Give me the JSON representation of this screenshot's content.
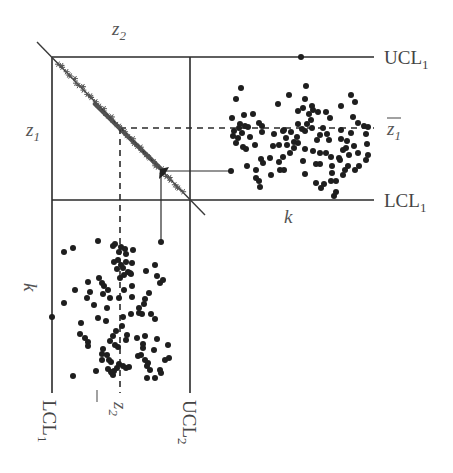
{
  "diagram": {
    "labels": {
      "z2_axis": "z",
      "z2_axis_sub": "2",
      "z1_axis": "z",
      "z1_axis_sub": "1",
      "ucl1": "UCL",
      "ucl1_sub": "1",
      "lcl1_right": "LCL",
      "lcl1_right_sub": "1",
      "z1_bar": "z",
      "z1_bar_sub": "1",
      "k_right": "k",
      "k_left": "k",
      "lcl1_bottom": "LCL",
      "lcl1_bottom_sub": "1",
      "z2_bar": "z",
      "z2_bar_sub": "2",
      "ucl2": "UCL",
      "ucl2_sub": "2"
    },
    "geometry": {
      "box_left": 52,
      "box_top": 57,
      "box_mid_x": 190,
      "box_mid_y": 200,
      "right_end": 374,
      "bottom_end": 393,
      "z1_bar_y": 128,
      "z2_bar_x": 120,
      "diag_start": [
        37,
        42
      ],
      "diag_end": [
        205,
        215
      ]
    },
    "arrow_point": {
      "source": [
        163,
        172
      ],
      "to_right_dot": [
        231,
        171
      ],
      "to_bottom_dot": [
        161,
        242
      ]
    },
    "colors": {
      "line": "#2a2a2a",
      "dot": "#1e1e1e",
      "label": "#444444"
    },
    "top_right_chart": {
      "name": "z1 chart (k horizontal)",
      "points": [
        [
          301,
          57
        ],
        [
          241,
          88
        ],
        [
          236,
          99
        ],
        [
          289,
          95
        ],
        [
          244,
          115
        ],
        [
          278,
          104
        ],
        [
          306,
          86
        ],
        [
          253,
          114
        ],
        [
          259,
          123
        ],
        [
          262,
          126
        ],
        [
          248,
          127
        ],
        [
          262,
          132
        ],
        [
          274,
          134
        ],
        [
          283,
          131
        ],
        [
          298,
          111
        ],
        [
          305,
          99
        ],
        [
          303,
          108
        ],
        [
          309,
          114
        ],
        [
          313,
          110
        ],
        [
          318,
          112
        ],
        [
          311,
          120
        ],
        [
          317,
          140
        ],
        [
          298,
          143
        ],
        [
          294,
          142
        ],
        [
          287,
          145
        ],
        [
          279,
          145
        ],
        [
          283,
          157
        ],
        [
          284,
          130
        ],
        [
          298,
          124
        ],
        [
          307,
          124
        ],
        [
          320,
          135
        ],
        [
          327,
          134
        ],
        [
          329,
          140
        ],
        [
          341,
          139
        ],
        [
          354,
          146
        ],
        [
          339,
          158
        ],
        [
          345,
          170
        ],
        [
          355,
          170
        ],
        [
          359,
          166
        ],
        [
          366,
          160
        ],
        [
          368,
          155
        ],
        [
          358,
          153
        ],
        [
          343,
          150
        ],
        [
          349,
          155
        ],
        [
          340,
          160
        ],
        [
          332,
          166
        ],
        [
          320,
          153
        ],
        [
          313,
          151
        ],
        [
          305,
          149
        ],
        [
          294,
          148
        ],
        [
          290,
          153
        ],
        [
          284,
          170
        ],
        [
          280,
          170
        ],
        [
          263,
          163
        ],
        [
          261,
          159
        ],
        [
          256,
          170
        ],
        [
          247,
          166
        ],
        [
          233,
          136
        ],
        [
          234,
          131
        ],
        [
          236,
          143
        ],
        [
          238,
          138
        ],
        [
          242,
          133
        ],
        [
          239,
          128
        ],
        [
          240,
          124
        ],
        [
          245,
          126
        ],
        [
          250,
          137
        ],
        [
          243,
          147
        ],
        [
          255,
          145
        ],
        [
          246,
          149
        ],
        [
          232,
          118
        ],
        [
          270,
          158
        ],
        [
          256,
          178
        ],
        [
          259,
          181
        ],
        [
          260,
          187
        ],
        [
          271,
          175
        ],
        [
          273,
          146
        ],
        [
          279,
          162
        ],
        [
          303,
          161
        ],
        [
          305,
          174
        ],
        [
          316,
          164
        ],
        [
          320,
          164
        ],
        [
          331,
          157
        ],
        [
          331,
          181
        ],
        [
          332,
          173
        ],
        [
          336,
          181
        ],
        [
          343,
          175
        ],
        [
          346,
          148
        ],
        [
          348,
          166
        ],
        [
          347,
          141
        ],
        [
          351,
          133
        ],
        [
          358,
          123
        ],
        [
          364,
          126
        ],
        [
          368,
          127
        ],
        [
          366,
          134
        ],
        [
          367,
          144
        ],
        [
          355,
          102
        ],
        [
          351,
          95
        ],
        [
          341,
          106
        ],
        [
          353,
          117
        ],
        [
          341,
          130
        ],
        [
          326,
          153
        ],
        [
          334,
          196
        ],
        [
          336,
          192
        ],
        [
          321,
          188
        ],
        [
          316,
          183
        ],
        [
          324,
          184
        ],
        [
          323,
          128
        ],
        [
          330,
          118
        ],
        [
          326,
          112
        ],
        [
          312,
          106
        ],
        [
          302,
          129
        ],
        [
          291,
          132
        ],
        [
          286,
          138
        ],
        [
          297,
          137
        ],
        [
          305,
          131
        ],
        [
          312,
          128
        ]
      ]
    },
    "bottom_left_chart": {
      "name": "z2 chart (k vertical)",
      "points": [
        [
          52,
          317
        ],
        [
          64,
          252
        ],
        [
          73,
          248
        ],
        [
          98,
          241
        ],
        [
          113,
          246
        ],
        [
          115,
          244
        ],
        [
          121,
          247
        ],
        [
          125,
          249
        ],
        [
          119,
          252
        ],
        [
          126,
          254
        ],
        [
          133,
          250
        ],
        [
          114,
          262
        ],
        [
          118,
          260
        ],
        [
          126,
          262
        ],
        [
          132,
          263
        ],
        [
          121,
          265
        ],
        [
          117,
          269
        ],
        [
          123,
          268
        ],
        [
          128,
          272
        ],
        [
          131,
          274
        ],
        [
          124,
          275
        ],
        [
          120,
          278
        ],
        [
          99,
          278
        ],
        [
          102,
          283
        ],
        [
          104,
          286
        ],
        [
          108,
          290
        ],
        [
          103,
          294
        ],
        [
          110,
          298
        ],
        [
          119,
          298
        ],
        [
          124,
          290
        ],
        [
          132,
          286
        ],
        [
          130,
          273
        ],
        [
          146,
          271
        ],
        [
          155,
          265
        ],
        [
          157,
          276
        ],
        [
          160,
          283
        ],
        [
          163,
          280
        ],
        [
          149,
          293
        ],
        [
          145,
          299
        ],
        [
          144,
          304
        ],
        [
          142,
          314
        ],
        [
          155,
          319
        ],
        [
          151,
          314
        ],
        [
          132,
          297
        ],
        [
          75,
          290
        ],
        [
          88,
          282
        ],
        [
          90,
          292
        ],
        [
          87,
          298
        ],
        [
          64,
          303
        ],
        [
          94,
          305
        ],
        [
          107,
          308
        ],
        [
          98,
          318
        ],
        [
          123,
          317
        ],
        [
          131,
          314
        ],
        [
          139,
          313
        ],
        [
          106,
          321
        ],
        [
          81,
          323
        ],
        [
          80,
          334
        ],
        [
          85,
          338
        ],
        [
          88,
          342
        ],
        [
          88,
          346
        ],
        [
          103,
          349
        ],
        [
          110,
          341
        ],
        [
          118,
          347
        ],
        [
          115,
          345
        ],
        [
          126,
          340
        ],
        [
          127,
          335
        ],
        [
          137,
          338
        ],
        [
          145,
          336
        ],
        [
          143,
          344
        ],
        [
          138,
          356
        ],
        [
          145,
          360
        ],
        [
          148,
          363
        ],
        [
          165,
          360
        ],
        [
          169,
          358
        ],
        [
          160,
          370
        ],
        [
          168,
          345
        ],
        [
          154,
          350
        ],
        [
          157,
          339
        ],
        [
          139,
          308
        ],
        [
          122,
          326
        ],
        [
          116,
          331
        ],
        [
          113,
          336
        ],
        [
          109,
          360
        ],
        [
          102,
          354
        ],
        [
          96,
          371
        ],
        [
          102,
          360
        ],
        [
          107,
          355
        ],
        [
          111,
          362
        ],
        [
          112,
          373
        ],
        [
          114,
          371
        ],
        [
          117,
          368
        ],
        [
          119,
          364
        ],
        [
          123,
          366
        ],
        [
          126,
          368
        ],
        [
          129,
          367
        ],
        [
          147,
          378
        ],
        [
          155,
          378
        ],
        [
          161,
          373
        ],
        [
          73,
          376
        ],
        [
          147,
          366
        ],
        [
          150,
          370
        ],
        [
          143,
          348
        ],
        [
          141,
          355
        ],
        [
          111,
          372
        ],
        [
          113,
          375
        ],
        [
          108,
          369
        ]
      ]
    },
    "diagonal_stars": {
      "from": [
        58,
        63
      ],
      "to": [
        182,
        192
      ],
      "count": 48
    }
  }
}
